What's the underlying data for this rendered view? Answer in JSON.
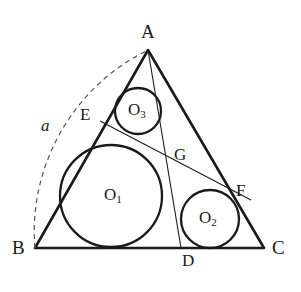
{
  "figure": {
    "kind": "geometry-diagram",
    "width": 301,
    "height": 292,
    "background_color": "#ffffff",
    "stroke_color": "#1a1a1a",
    "dashed_stroke_color": "#555555"
  },
  "labels": {
    "apex": "A",
    "base_left": "B",
    "base_right": "C",
    "tangent_d": "D",
    "tangent_e": "E",
    "tangent_f": "F",
    "point_g": "G",
    "circle_one": "O",
    "circle_one_sub": "1",
    "circle_two": "O",
    "circle_two_sub": "2",
    "circle_three": "O",
    "circle_three_sub": "3",
    "arc_side": "a"
  },
  "geometry": {
    "triangle": {
      "A": [
        148,
        50
      ],
      "B": [
        35,
        248
      ],
      "C": [
        264,
        248
      ]
    },
    "circles": [
      {
        "name": "O1",
        "cx": 111,
        "cy": 196,
        "r": 51
      },
      {
        "name": "O2",
        "cx": 210,
        "cy": 219,
        "r": 29
      },
      {
        "name": "O3",
        "cx": 138,
        "cy": 111,
        "r": 23
      }
    ],
    "cevian_AD": {
      "from": [
        148,
        50
      ],
      "to": [
        181,
        248
      ]
    },
    "segment_EF": {
      "from": [
        100,
        121
      ],
      "to": [
        250,
        200
      ]
    },
    "point_G": [
      178,
      158
    ],
    "tangent_points": {
      "D": [
        181,
        248
      ],
      "E": [
        100,
        121
      ],
      "F": [
        250,
        200
      ]
    },
    "arc": {
      "from": [
        35,
        248
      ],
      "to": [
        148,
        50
      ],
      "control": [
        40,
        88
      ],
      "dashed": true
    }
  },
  "label_positions": {
    "A": [
      141,
      22
    ],
    "B": [
      12,
      238
    ],
    "C": [
      272,
      238
    ],
    "D": [
      182,
      252
    ],
    "E": [
      80,
      106
    ],
    "F": [
      236,
      182
    ],
    "G": [
      174,
      146
    ],
    "O1": [
      104,
      186
    ],
    "O2": [
      199,
      209
    ],
    "O3": [
      128,
      101
    ],
    "a": [
      41,
      117
    ]
  }
}
